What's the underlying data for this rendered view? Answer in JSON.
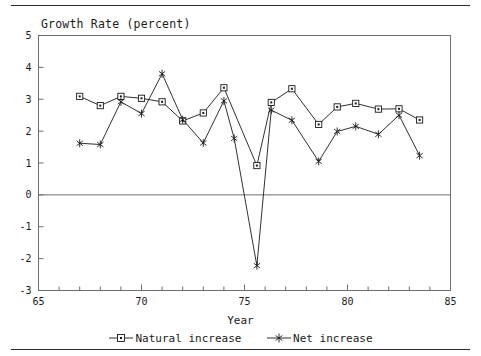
{
  "chart_data": {
    "type": "line",
    "title": "Growth Rate (percent)",
    "xlabel": "Year",
    "ylabel": "",
    "xlim": [
      65,
      85
    ],
    "ylim": [
      -3,
      5
    ],
    "xticks": [
      65,
      70,
      75,
      80,
      85
    ],
    "xtick_labels": [
      "65",
      "70",
      "75",
      "80",
      "85"
    ],
    "xminor_step": 1,
    "yticks": [
      -3,
      -2,
      -1,
      0,
      1,
      2,
      3,
      4,
      5
    ],
    "ytick_labels": [
      "-3",
      "-2",
      "-1",
      "0",
      "1",
      "2",
      "3",
      "4",
      "5"
    ],
    "grid": false,
    "zero_line": true,
    "legend_position": "below",
    "series": [
      {
        "name": "Natural increase",
        "marker": "square",
        "color": "#1a1a1a",
        "x": [
          67,
          68,
          69,
          70,
          71,
          72,
          73,
          74,
          75.6,
          76.3,
          77.3,
          78.6,
          79.5,
          80.4,
          81.5,
          82.5,
          83.5
        ],
        "values": [
          3.09,
          2.8,
          3.09,
          3.03,
          2.92,
          2.32,
          2.57,
          3.36,
          0.92,
          2.9,
          3.33,
          2.21,
          2.76,
          2.87,
          2.69,
          2.7,
          2.35
        ]
      },
      {
        "name": "Net increase",
        "marker": "asterisk",
        "color": "#1a1a1a",
        "x": [
          67,
          68,
          69,
          70,
          71,
          72,
          73,
          74,
          74.5,
          75.6,
          76.3,
          77.3,
          78.6,
          79.5,
          80.4,
          81.5,
          82.5,
          83.5
        ],
        "values": [
          1.62,
          1.58,
          2.92,
          2.55,
          3.8,
          2.36,
          1.63,
          2.95,
          1.77,
          -2.22,
          2.66,
          2.34,
          1.05,
          1.99,
          2.15,
          1.9,
          2.5,
          1.23
        ]
      }
    ]
  },
  "legend": {
    "entries": [
      {
        "label": "Natural increase",
        "marker": "square-marker-icon"
      },
      {
        "label": "Net increase",
        "marker": "asterisk-marker-icon"
      }
    ]
  },
  "axis": {
    "x_title": "Year"
  }
}
